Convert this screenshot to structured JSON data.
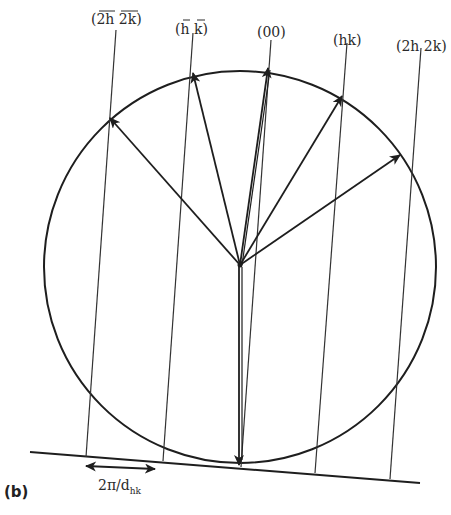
{
  "diagram": {
    "panel_label": "(b)",
    "beam_labels": [
      {
        "id": "2h2k-bar",
        "text": "(2h 2k)",
        "overline": true
      },
      {
        "id": "hk-bar",
        "text": "(h k)",
        "overline": true
      },
      {
        "id": "00",
        "text": "(00)",
        "overline": false
      },
      {
        "id": "hk",
        "text": "(hk)",
        "overline": false
      },
      {
        "id": "2h2k",
        "text": "(2h 2k)",
        "overline": false
      }
    ],
    "spacing_label": "2π/d",
    "spacing_subscript": "hk",
    "elements": {
      "ewald_sphere": "circle",
      "incident_vector": "downward arrow to tangent point",
      "reciprocal_rods": 5,
      "scattered_vectors": 5
    },
    "colors": {
      "line": "#1e1e1e",
      "background": "#ffffff"
    }
  }
}
